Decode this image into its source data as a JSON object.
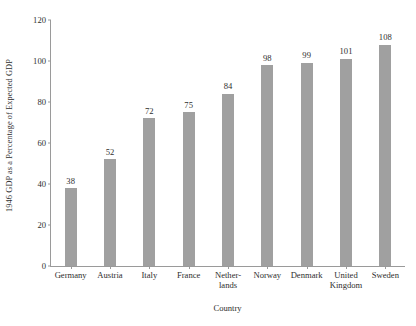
{
  "chart_data": {
    "type": "bar",
    "title": "",
    "subtitle": "",
    "xlabel": "Country",
    "ylabel": "1946 GDP as a Percentage of Expected GDP",
    "categories": [
      "Germany",
      "Austria",
      "Italy",
      "France",
      "Nether-\nlands",
      "Norway",
      "Denmark",
      "United\nKingdom",
      "Sweden"
    ],
    "category_lines": [
      [
        "Germany"
      ],
      [
        "Austria"
      ],
      [
        "Italy"
      ],
      [
        "France"
      ],
      [
        "Nether-",
        "lands"
      ],
      [
        "Norway"
      ],
      [
        "Denmark"
      ],
      [
        "United",
        "Kingdom"
      ],
      [
        "Sweden"
      ]
    ],
    "values": [
      38,
      52,
      72,
      75,
      84,
      98,
      99,
      101,
      108
    ],
    "data_labels": [
      "38",
      "52",
      "72",
      "75",
      "84",
      "98",
      "99",
      "101",
      "108"
    ],
    "ylim": [
      0,
      120
    ],
    "yticks": [
      0,
      20,
      40,
      60,
      80,
      100,
      120
    ],
    "ytick_labels": [
      "0",
      "20",
      "40",
      "60",
      "80",
      "100",
      "120"
    ],
    "grid": false,
    "legend": false,
    "legend_position": "none",
    "bar_color": "#a0a0a0",
    "axis_color": "#9a9a9a",
    "text_color": "#2e2e2e"
  }
}
